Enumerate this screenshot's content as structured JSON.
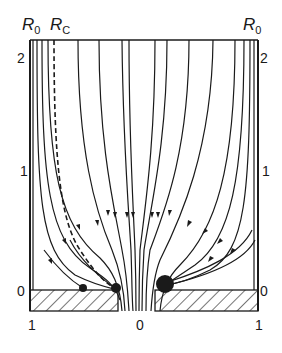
{
  "figure": {
    "labels": {
      "r0_left": "R",
      "r0_left_sub": "0",
      "rc": "R",
      "rc_sub": "C",
      "r0_right": "R",
      "r0_right_sub": "0"
    },
    "y_axis_left": [
      "2",
      "1",
      "0"
    ],
    "y_axis_right": [
      "2",
      "1",
      "0"
    ],
    "x_axis": [
      "1",
      "0",
      "1"
    ]
  },
  "colors": {
    "ink": "#1a1a1a",
    "background": "#ffffff"
  }
}
